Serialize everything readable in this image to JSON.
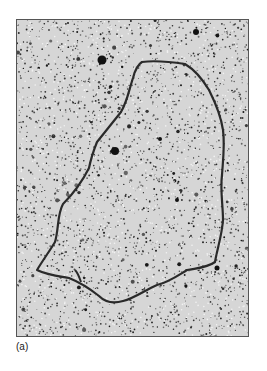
{
  "figure": {
    "panel_label": "(a)",
    "image_description": "electron micrograph of a circular DNA molecule on a speckled background",
    "colors": {
      "background": "#d8d8d8",
      "speckle": "#1a1a1a",
      "strand": "#2a2a2a",
      "border": "#555555"
    }
  }
}
